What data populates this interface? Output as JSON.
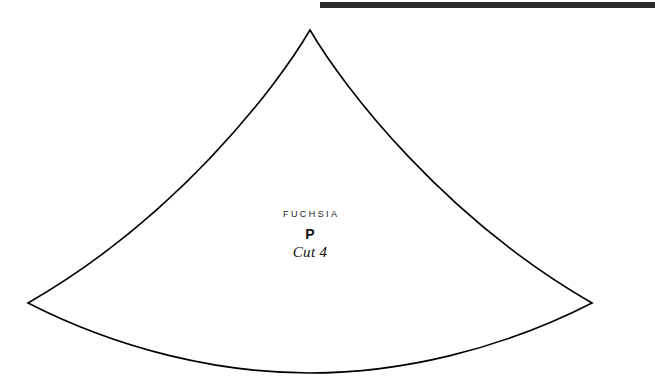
{
  "page": {
    "background_color": "#ffffff",
    "width": 655,
    "height": 383
  },
  "top_rule": {
    "name": "top-black-bar",
    "color": "#2d2d2d",
    "x": 320,
    "y": 2,
    "width": 335,
    "height": 6
  },
  "pattern_piece": {
    "outline_color": "#000000",
    "outline_width": 1.6,
    "fill_color": "#ffffff",
    "apex": {
      "x": 310,
      "y": 30
    },
    "left_point": {
      "x": 28,
      "y": 303
    },
    "right_point": {
      "x": 592,
      "y": 303
    },
    "bottom_low": {
      "x": 310,
      "y": 373
    },
    "path": "M 310 30 C 276 88, 176 218, 28 303 C 120 350, 220 373, 310 373 C 400 373, 500 350, 592 303 C 444 218, 344 88, 310 30 Z"
  },
  "labels": {
    "fabric": "FUCHSIA",
    "piece_letter": "P",
    "cut_instruction": "Cut 4"
  }
}
